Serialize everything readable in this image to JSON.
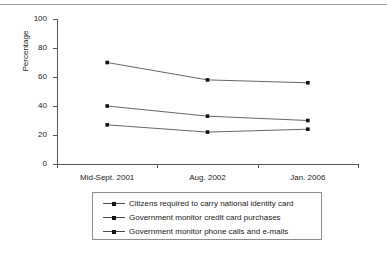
{
  "top_clipped_text": "p pp",
  "chart_data": {
    "type": "line",
    "title": "",
    "xlabel": "",
    "ylabel": "Percentage",
    "ylim": [
      0,
      100
    ],
    "yticks": [
      0,
      20,
      40,
      60,
      80,
      100
    ],
    "ytick_labels": [
      "0",
      "20",
      "40",
      "60",
      "80",
      "100"
    ],
    "categories": [
      "Mid-Sept. 2001",
      "Aug. 2002",
      "Jan. 2006"
    ],
    "grid": false,
    "legend_position": "below",
    "series": [
      {
        "name": "Citizens required to carry national identity card",
        "values": [
          70,
          58,
          56
        ]
      },
      {
        "name": "Government monitor credit card purchases",
        "values": [
          40,
          33,
          30
        ]
      },
      {
        "name": "Government monitor phone calls and e-mails",
        "values": [
          27,
          22,
          24
        ]
      }
    ],
    "line_color": "#555555",
    "marker_color": "#111111"
  }
}
